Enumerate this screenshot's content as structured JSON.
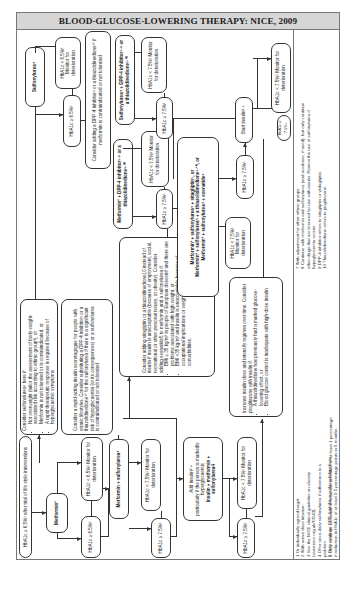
{
  "title": "BLOOD-GLUCOSE-LOWERING THERAPY: NICE, 2009",
  "nodes": {
    "start": "HbA1c ≥ 6.5%¹ after trial of life style interventions",
    "metformin": "Metformin²",
    "met_lt": "HbA1c < 6.5%¹ Monitor for deterioration",
    "met_ge": "HbA1c ≥ 6.5%¹",
    "consider_su_title": "Consider sulfonylurea⁴ here if:",
    "consider_su_items": [
      "Not overweight (tailor the assessment of body-weight-associated risk according to ethnic group³), or",
      "Metformin is not tolerated or is contraindicated, or",
      "A rapid therapeutic response is required because of hyperglycaemic symptoms"
    ],
    "rapid_acting": "Consider a rapid-acting insulin secretagogue for people with erratic lifestyles. Consider substituting a DPP-4 inhibitor⁹ or a thiazolidinedione¹⁰ for the sulfonylurea if there is a significant risk of hypoglycaemia (or its consequences) or a sulfonylurea is contraindicated or not tolerated",
    "sulfonylurea": "Sulfonylurea⁴",
    "su_lt": "HbA1c < 6.5%¹ Monitor for deterioration",
    "su_ge": "HbA1c ≥ 6.5%¹",
    "consider_dpp4": "Consider adding a DPP-4 inhibitor⁹ or a thiazolidinedione¹⁰ if metformin is contraindicated or not tolerated",
    "met_su": "Metformin + sulfonylurea⁴",
    "metsu_lt": "HbA1c < 7.5%¹ Monitor for deterioration",
    "metsu_ge": "HbA1c ≥ 7.5%¹",
    "add_insulin_l1": "Add insulin²·⁸",
    "add_insulin_l2": "particularly if the person is markedly hyperglycaemic",
    "add_insulin_l3": "Insulin + metformin + sulfonylurea4",
    "consider_sitagliptin_intro": "Consider adding sitagliptin or a thiazolidinedione10 instead of insulin if insulin is unacceptable (because of employment, social, recreational or other personal issues, or obesity). Consider adding exenatide5 to metformin and a sulfonylurea if:",
    "consider_sitagliptin_items": [
      "BMI ≥ 35 kg/m² in people of European descent³ and there are problems associated with high weight, or",
      "BMI <35 kg/m² and insulin is unacceptable because of occupational implications or weight loss would benefit other comorbidities."
    ],
    "met_dpp4": "Metformin² + DPP-4 inhibitor⁵·⁹ or a thiazolidinedione⁵·¹⁰",
    "metdpp_lt": "HbA1c < 7.5%¹ Monitor for deterioration",
    "metdpp_ge": "HbA1c ≥ 7.5%¹",
    "triple_l1": "Metformin² + sulfonylurea⁴ + sitagliptin⁵, or",
    "triple_l2": "Metformin² + sulfonylurea⁴ + a thiazolidinedione⁵·¹⁰, or",
    "triple_l3": "Metformin² + sulfonylurea⁴ + exenatide⁶",
    "su_dpp4": "Sulfonylurea⁴ + DPP-4 inhibitor⁵·⁹ or a thiazolidinedione⁵·¹⁰",
    "sudpp_lt": "HbA1c < 7.5%¹ Monitor for deterioration",
    "sudpp_ge": "HbA1c ≥ 7.5%¹",
    "triple_lt": "HbA1c < 7.5%¹ Monitor for deterioration",
    "triple_ge": "HbA1c ≥ 7.5%¹",
    "start_insulin": "Start insulin²·⁸",
    "ins_lt": "HbA1c < 7.5%¹ Monitor for deterioration",
    "ins_ge": "HbA1c ≥ 7.5%¹",
    "insmet_lt": "HbA1c < 7.5%¹ Monitor for deterioration",
    "insmet_ge": "HbA1c ≥ 7.5%¹",
    "increase_insulin_intro": "Increase insulin dose and intensify regimen over time. Consider pioglitazone with insulin if:",
    "increase_insulin_items": [
      "A thiazolidinedione has previously had a marked glucose-lowering effect, or",
      "Blood glucose control is inadequate with high-dose insulin"
    ]
  },
  "footnotes_left": [
    "1 Or individually agreed target.",
    "2 With active dose titration.",
    "3 See the NICE clinical guideline on obesity",
    "   (www.nice.org.uk/CG43).",
    "4 Offer once-daily sulfonylurea if adherence is a",
    "   problem.",
    "5 Only continue DPP-4 inhibitor or thiazolidinedione",
    "   if reduction in HbA1c of at least 0.5 percentage points in 6 months.",
    "6 Only continue exenatide if reduction in HbA1c of at least 1 percentage",
    "   point and weight loss of at least 3% of initial body weight at 6 months."
  ],
  "footnotes_right": [
    "7 With adjustment for other ethnic groups.",
    "8 Continue with metformin and sulfonylurea (and acarbose, if used), but only continue",
    "   other drugs that are licensed for use with insulin. Review the use of sulfonylurea if",
    "   hypoglycaemia occurs.",
    "9 DPP-4 inhibitor refers to sitagliptin or vildagliptin.",
    "10 Thiazolidinedione refers to pioglitazone."
  ]
}
